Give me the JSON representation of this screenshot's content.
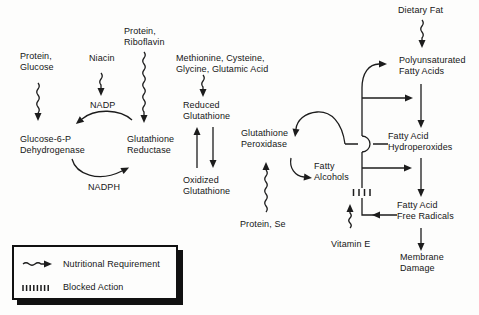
{
  "figure": {
    "type": "biochemical-pathway-diagram",
    "ink_color": "#1c1c1c",
    "background_color": "#fdfdfc"
  },
  "nodes": {
    "protein_glucose": "Protein,\nGlucose",
    "niacin": "Niacin",
    "protein_riboflavin": "Protein,\nRiboflavin",
    "methionine_cysteine": "Methionine, Cysteine,\nGlycine, Glutamic Acid",
    "nadp": "NADP",
    "nadph": "NADPH",
    "glucose_6_p_dehydrogenase": "Glucose-6-P\nDehydrogenase",
    "glutathione_reductase": "Glutathione\nReductase",
    "reduced_glutathione": "Reduced\nGlutathione",
    "oxidized_glutathione": "Oxidized\nGlutathione",
    "glutathione_peroxidase": "Glutathione\nPeroxidase",
    "protein_se": "Protein, Se",
    "fatty_alcohols": "Fatty\nAlcohols",
    "dietary_fat": "Dietary Fat",
    "polyunsaturated_fatty_acids": "Polyunsaturated\nFatty Acids",
    "fatty_acid_hydroperoxides": "Fatty Acid\nHydroperoxides",
    "fatty_acid_free_radicals": "Fatty Acid\nFree Radicals",
    "membrane_damage": "Membrane\nDamage",
    "vitamin_e": "Vitamin E"
  },
  "legend": {
    "nutritional_requirement": "Nutritional Requirement",
    "blocked_action": "Blocked Action"
  },
  "icons": [
    "wavy-arrow-icon = nutritional requirement",
    "hatch-marks-icon = blocked action",
    "solid-arrow-icon = reaction / flow"
  ]
}
